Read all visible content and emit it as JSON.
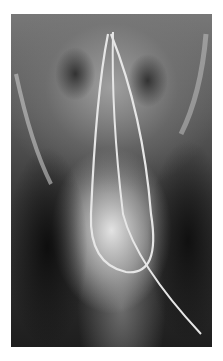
{
  "image": {
    "description": "Frontal radiograph of skull base and cervical region with a looped catheter/wire",
    "frame": {
      "left": 11,
      "top": 14,
      "width": 201,
      "height": 333
    },
    "colors": {
      "background": "#ffffff",
      "film_dark": "#1a1a1a",
      "wire": "#e8e8e8"
    }
  }
}
